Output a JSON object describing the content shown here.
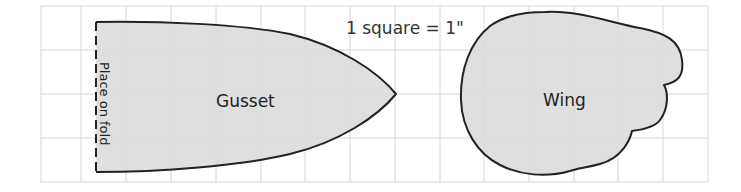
{
  "diagram": {
    "title": "1 square = 1\"",
    "grid": {
      "cols": 15,
      "rows": 4,
      "unit": "1 inch per square"
    },
    "pieces": [
      {
        "name": "Gusset",
        "annotation": "Place on fold"
      },
      {
        "name": "Wing"
      }
    ],
    "colors": {
      "fill": "#dcdcdc",
      "outline": "#222222",
      "grid": "#d4d4d4"
    }
  }
}
